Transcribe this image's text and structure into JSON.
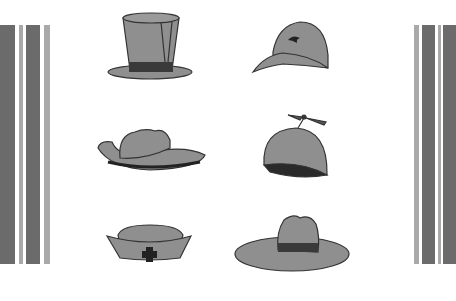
{
  "scene": {
    "title": "Hat collection",
    "colors": {
      "fill": "#8f8f8f",
      "outline": "#333333",
      "band": "#3a3a3a",
      "stripe_dark": "#6b6b6b",
      "stripe_light": "#a9a9a9",
      "background": "#ffffff"
    },
    "hats": [
      {
        "name": "top-hat"
      },
      {
        "name": "baseball-cap"
      },
      {
        "name": "cowboy-hat"
      },
      {
        "name": "propeller-beanie"
      },
      {
        "name": "nurse-cap"
      },
      {
        "name": "wide-brim-sun-hat"
      }
    ]
  }
}
